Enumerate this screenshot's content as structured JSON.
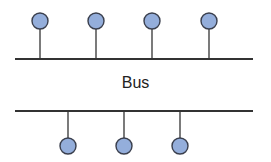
{
  "diagram": {
    "title": "Bus",
    "colors": {
      "line": "#333333",
      "node_fill": "#94aedb",
      "node_stroke": "#3a3f4d"
    },
    "top_bus": {
      "y": 59,
      "x1": 15,
      "x2": 253
    },
    "bottom_bus": {
      "y": 111,
      "x1": 15,
      "x2": 253
    },
    "top_nodes": [
      {
        "x": 40,
        "y": 21
      },
      {
        "x": 96,
        "y": 21
      },
      {
        "x": 152,
        "y": 21
      },
      {
        "x": 209,
        "y": 21
      }
    ],
    "bottom_nodes": [
      {
        "x": 68,
        "y": 146
      },
      {
        "x": 124,
        "y": 146
      },
      {
        "x": 180,
        "y": 146
      }
    ],
    "node_radius": 8
  }
}
